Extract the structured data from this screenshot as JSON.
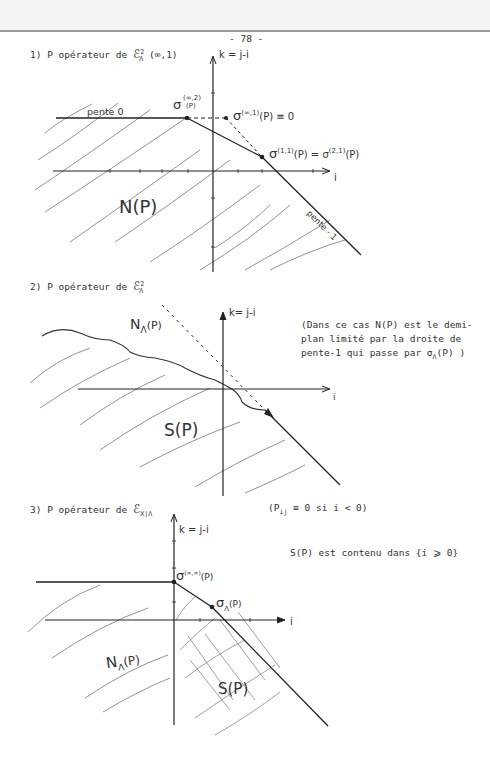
{
  "page": {
    "page_number": "- 78 -"
  },
  "sections": [
    {
      "title_prefix": "1) P opérateur de",
      "title_symbol": "ℰ",
      "title_sup": "2",
      "title_sub": "Λ",
      "title_suffix": "(∞,1)",
      "axis_k_label": "k = j-i",
      "axis_i_label": "i",
      "label_slope0": "pente 0",
      "label_slope_minus1": "pente - 1",
      "label_sigma_inf2": "σ",
      "label_sigma_inf2_sup": "(∞,2)",
      "label_sigma_inf2_arg": "(P)",
      "label_sigma_inf1": "σ",
      "label_sigma_inf1_sup": "(∞,1)",
      "label_sigma_inf1_tail": "(P) ≡ 0",
      "label_sigma_11": "σ",
      "label_sigma_11_sup": "(1,1)",
      "label_sigma_11_tail": "(P) = σ",
      "label_sigma_21_sup": "(2,1)",
      "label_sigma_21_tail": "(P)",
      "region_label": "N(P)"
    },
    {
      "title_prefix": "2) P opérateur de",
      "title_symbol": "ℰ",
      "title_sup": "2",
      "title_sub": "Λ",
      "axis_k_label": "k= j-i",
      "axis_i_label": "i",
      "region_upper_label": "N",
      "region_upper_sub": "Λ",
      "region_upper_arg": "(P)",
      "region_lower_label": "S(P)",
      "note_lines": [
        "(Dans ce cas N(P) est le demi-",
        "plan limité par la droite de",
        "pente-1 qui passe par σ",
        "(P) )"
      ],
      "note_sub": "Λ"
    },
    {
      "title_prefix": "3) P opérateur de",
      "title_symbol": "ℰ",
      "title_sub": "X|Λ",
      "condition_prefix": "(P",
      "condition_sub": "ij",
      "condition_suffix": " ≡ 0 si i < 0)",
      "axis_k_label": "k = j-i",
      "axis_i_label": "i",
      "label_sigma_infinf": "σ",
      "label_sigma_infinf_sup": "(∞,∞)",
      "label_sigma_infinf_arg": "(P)",
      "label_sigma": "σ",
      "label_sigma_arg": "(P)",
      "region_upper_label": "N",
      "region_upper_sub": "Λ",
      "region_upper_arg": "(P)",
      "region_lower_label": "S(P)",
      "side_note": "S(P) est contenu dans {i ⩾ 0}"
    }
  ]
}
